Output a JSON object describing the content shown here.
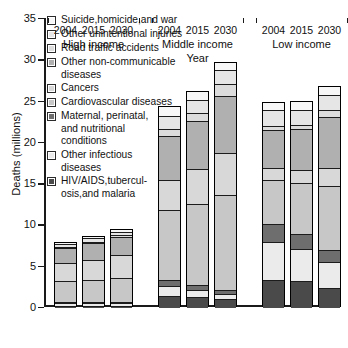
{
  "chart_data": {
    "type": "bar",
    "subtype": "stacked-bar-grouped",
    "title": "",
    "xlabel": "Year",
    "ylabel": "Deaths (millions)",
    "ylim": [
      0,
      35
    ],
    "ytick_step": 5,
    "yticks": [
      0,
      5,
      10,
      15,
      20,
      25,
      30,
      35
    ],
    "grid": false,
    "legend_position": "upper-left-inside",
    "groups": [
      "High income",
      "Middle income",
      "Low income"
    ],
    "categories": [
      "2004",
      "2015",
      "2030"
    ],
    "series": [
      {
        "name": "HIV/AIDS,tubercul-\nosis,and malaria",
        "color": "#4a4a4a",
        "values": {
          "High income": [
            0.2,
            0.2,
            0.2
          ],
          "Middle income": [
            1.3,
            1.2,
            1.0
          ],
          "Low income": [
            3.3,
            3.1,
            2.3
          ]
        }
      },
      {
        "name": "Other infectious\ndiseases",
        "color": "#ebebeb",
        "values": {
          "High income": [
            0.3,
            0.3,
            0.3
          ],
          "Middle income": [
            1.2,
            0.9,
            0.6
          ],
          "Low income": [
            4.6,
            3.9,
            3.2
          ]
        }
      },
      {
        "name": "Maternal, perinatal,\nand nutritional\nconditions",
        "color": "#6e6e6e",
        "values": {
          "High income": [
            0.1,
            0.1,
            0.1
          ],
          "Middle income": [
            0.8,
            0.6,
            0.4
          ],
          "Low income": [
            2.2,
            1.8,
            1.4
          ]
        }
      },
      {
        "name": "Cardiovascular diseases",
        "color": "#c7c7c7",
        "values": {
          "High income": [
            2.6,
            2.7,
            2.9
          ],
          "Middle income": [
            8.5,
            9.8,
            11.6
          ],
          "Low income": [
            5.3,
            6.2,
            7.7
          ]
        }
      },
      {
        "name": "Cancers",
        "color": "#d8d8d8",
        "values": {
          "High income": [
            2.1,
            2.4,
            2.8
          ],
          "Middle income": [
            3.6,
            4.2,
            5.1
          ],
          "Low income": [
            1.4,
            1.6,
            2.2
          ]
        }
      },
      {
        "name": "Other non-communicable\ndiseases",
        "color": "#b0b0b0",
        "values": {
          "High income": [
            1.8,
            2.0,
            2.2
          ],
          "Middle income": [
            5.3,
            5.8,
            6.9
          ],
          "Low income": [
            4.6,
            4.9,
            6.2
          ]
        }
      },
      {
        "name": "Road traffic accidents",
        "color": "#dcdcdc",
        "values": {
          "High income": [
            0.2,
            0.2,
            0.2
          ],
          "Middle income": [
            0.8,
            1.0,
            1.4
          ],
          "Low income": [
            0.5,
            0.6,
            0.8
          ]
        }
      },
      {
        "name": "Other unintentional injuries",
        "color": "#e6e6e6",
        "values": {
          "High income": [
            0.3,
            0.4,
            0.4
          ],
          "Middle income": [
            1.6,
            1.6,
            1.7
          ],
          "Low income": [
            1.9,
            1.8,
            1.9
          ]
        }
      },
      {
        "name": "Suicide,homicide,and war",
        "color": "#f7f7f7",
        "values": {
          "High income": [
            0.3,
            0.3,
            0.3
          ],
          "Middle income": [
            1.2,
            1.1,
            1.0
          ],
          "Low income": [
            1.0,
            1.0,
            1.1
          ]
        }
      }
    ],
    "totals": {
      "High income": [
        7.9,
        8.6,
        9.4
      ],
      "Middle income": [
        24.3,
        26.2,
        29.7
      ],
      "Low income": [
        24.8,
        24.9,
        26.8
      ]
    }
  },
  "legend": {
    "items": [
      {
        "label": "Suicide,homicide,and war",
        "color": "#f7f7f7"
      },
      {
        "label": "Other unintentional injuries",
        "color": "#e6e6e6"
      },
      {
        "label": "Road traffic accidents",
        "color": "#dcdcdc"
      },
      {
        "label": "Other non-communicable\ndiseases",
        "color": "#b0b0b0"
      },
      {
        "label": "Cancers",
        "color": "#d8d8d8"
      },
      {
        "label": "Cardiovascular diseases",
        "color": "#c7c7c7"
      },
      {
        "label": "Maternal, perinatal,\nand nutritional\nconditions",
        "color": "#6e6e6e"
      },
      {
        "label": "Other infectious\ndiseases",
        "color": "#ebebeb"
      },
      {
        "label": "HIV/AIDS,tubercul-\nosis,and malaria",
        "color": "#4a4a4a"
      }
    ]
  },
  "axes": {
    "y_title": "Deaths (millions)",
    "x_title": "Year",
    "y_ticks": [
      "35",
      "30",
      "25",
      "20",
      "15",
      "10",
      "5",
      "0"
    ],
    "group_labels": [
      "High income",
      "Middle income",
      "Low income"
    ],
    "year_labels": [
      "2004",
      "2015",
      "2030"
    ]
  }
}
